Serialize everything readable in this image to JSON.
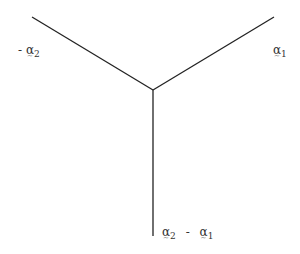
{
  "diagram": {
    "type": "root-system-vectors",
    "center": [
      153,
      90
    ],
    "rays": [
      {
        "name": "minus-alpha2",
        "end": [
          32,
          17
        ]
      },
      {
        "name": "alpha1",
        "end": [
          274,
          17
        ]
      },
      {
        "name": "alpha2-minus-alpha1",
        "end": [
          153,
          236
        ]
      }
    ],
    "line_color": "#222222"
  },
  "labels": {
    "minus_alpha2": {
      "sign": "-",
      "symbol": "α",
      "sub": "2"
    },
    "alpha1": {
      "symbol": "α",
      "sub": "1"
    },
    "alpha2_minus_alpha1": {
      "symbol_a": "α",
      "sub_a": "2",
      "op": "-",
      "symbol_b": "α",
      "sub_b": "1"
    }
  }
}
